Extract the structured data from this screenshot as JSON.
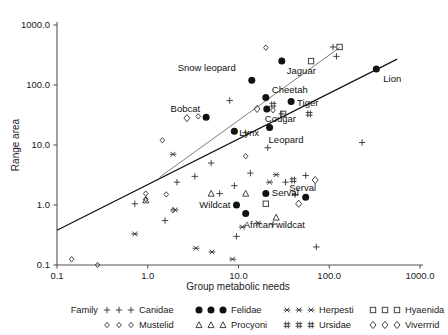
{
  "chart_data": {
    "type": "scatter",
    "title": "",
    "xlabel": "Group metabolic needs",
    "ylabel": "Range area",
    "xscale": "log",
    "yscale": "log",
    "xlim": [
      0.1,
      1000.0
    ],
    "ylim": [
      0.1,
      1000.0
    ],
    "xticks": [
      "0.1",
      "1.0",
      "10.0",
      "100.0",
      "1000.0"
    ],
    "yticks": [
      "0.1",
      "1.0",
      "10.0",
      "100.0",
      "1000.0"
    ],
    "grid": false,
    "legend_position": "below-axes",
    "series": [
      {
        "name": "Canidae",
        "marker": "plus",
        "points": [
          {
            "x": 0.72,
            "y": 1.05
          },
          {
            "x": 1.55,
            "y": 0.55
          },
          {
            "x": 2.1,
            "y": 2.4
          },
          {
            "x": 3.3,
            "y": 3.0
          },
          {
            "x": 5.0,
            "y": 5.0
          },
          {
            "x": 6.2,
            "y": 1.55
          },
          {
            "x": 8.0,
            "y": 55.0
          },
          {
            "x": 9.0,
            "y": 2.1
          },
          {
            "x": 9.5,
            "y": 0.3
          },
          {
            "x": 12.0,
            "y": 16.0
          },
          {
            "x": 13.5,
            "y": 3.4
          },
          {
            "x": 21.0,
            "y": 9.0
          },
          {
            "x": 24.0,
            "y": 0.48
          },
          {
            "x": 30.0,
            "y": 33.0
          },
          {
            "x": 33.0,
            "y": 2.4
          },
          {
            "x": 42.0,
            "y": 1.5
          },
          {
            "x": 55.0,
            "y": 3.1
          },
          {
            "x": 72.0,
            "y": 0.2
          },
          {
            "x": 110.0,
            "y": 430.0
          },
          {
            "x": 120.0,
            "y": 300.0
          },
          {
            "x": 230.0,
            "y": 11.0
          }
        ]
      },
      {
        "name": "Felidae",
        "marker": "filled-circle",
        "points": [
          {
            "x": 4.4,
            "y": 29.0,
            "label": "Bobcat"
          },
          {
            "x": 9.0,
            "y": 17.0,
            "label": "Lynx"
          },
          {
            "x": 14.0,
            "y": 120.0,
            "label": "Snow leopard"
          },
          {
            "x": 20.0,
            "y": 62.0,
            "label": "Cheetah"
          },
          {
            "x": 20.5,
            "y": 40.0,
            "label": "Cougar"
          },
          {
            "x": 22.0,
            "y": 19.5,
            "label": "Leopard"
          },
          {
            "x": 30.0,
            "y": 250.0,
            "label": "Jaguar"
          },
          {
            "x": 38.0,
            "y": 53.0,
            "label": "Tiger"
          },
          {
            "x": 330.0,
            "y": 185.0,
            "label": "Lion"
          },
          {
            "x": 9.5,
            "y": 1.0,
            "label": "Wildcat"
          },
          {
            "x": 12.0,
            "y": 0.72,
            "label": "African wildcat"
          },
          {
            "x": 20.0,
            "y": 1.55,
            "label": "Serval"
          },
          {
            "x": 55.0,
            "y": 1.35,
            "label": "Serval"
          }
        ]
      },
      {
        "name": "Herpesti",
        "marker": "asterisk",
        "points": [
          {
            "x": 0.72,
            "y": 0.33
          },
          {
            "x": 1.9,
            "y": 7.0
          },
          {
            "x": 2.0,
            "y": 0.83
          },
          {
            "x": 3.4,
            "y": 0.19
          },
          {
            "x": 5.1,
            "y": 0.165
          },
          {
            "x": 8.6,
            "y": 0.125
          },
          {
            "x": 11.0,
            "y": 0.43
          },
          {
            "x": 16.5,
            "y": 0.5
          },
          {
            "x": 22.0,
            "y": 2.4
          },
          {
            "x": 26.0,
            "y": 3.2
          }
        ]
      },
      {
        "name": "Hyaenida",
        "marker": "open-square",
        "points": [
          {
            "x": 20.0,
            "y": 1.05
          },
          {
            "x": 31.0,
            "y": 33.0
          },
          {
            "x": 63.0,
            "y": 250.0
          },
          {
            "x": 130.0,
            "y": 430.0
          }
        ]
      },
      {
        "name": "Mustelid",
        "marker": "small-diamond",
        "points": [
          {
            "x": 0.145,
            "y": 0.125
          },
          {
            "x": 0.28,
            "y": 0.1
          },
          {
            "x": 0.95,
            "y": 1.55
          },
          {
            "x": 0.95,
            "y": 1.25
          },
          {
            "x": 1.45,
            "y": 12.0
          },
          {
            "x": 1.6,
            "y": 1.5
          },
          {
            "x": 1.9,
            "y": 0.82
          },
          {
            "x": 3.6,
            "y": 30.0
          },
          {
            "x": 12.0,
            "y": 6.5
          },
          {
            "x": 20.0,
            "y": 420.0
          },
          {
            "x": 24.0,
            "y": 38.0
          }
        ]
      },
      {
        "name": "Procyoni",
        "marker": "open-triangle",
        "points": [
          {
            "x": 0.95,
            "y": 1.2
          },
          {
            "x": 5.0,
            "y": 1.55
          },
          {
            "x": 12.0,
            "y": 1.55
          },
          {
            "x": 26.0,
            "y": 0.62
          }
        ]
      },
      {
        "name": "Ursidae",
        "marker": "double-plus",
        "points": [
          {
            "x": 24.0,
            "y": 47.0
          },
          {
            "x": 40.0,
            "y": 2.6
          },
          {
            "x": 60.0,
            "y": 33.0
          }
        ]
      },
      {
        "name": "Viverrrid",
        "marker": "open-diamond",
        "points": [
          {
            "x": 2.7,
            "y": 28.0
          },
          {
            "x": 16.0,
            "y": 40.0
          },
          {
            "x": 46.0,
            "y": 1.05
          },
          {
            "x": 70.0,
            "y": 2.6
          }
        ]
      }
    ],
    "trend_lines": [
      {
        "name": "lower-regression",
        "x1": 0.1,
        "y1": 0.38,
        "x2": 560.0,
        "y2": 270.0
      },
      {
        "name": "upper-regression",
        "x1": 1.35,
        "y1": 2.9,
        "x2": 130.0,
        "y2": 420.0
      }
    ],
    "point_labels": [
      "Snow leopard",
      "Jaguar",
      "Cheetah",
      "Tiger",
      "Lion",
      "Bobcat",
      "Cougar",
      "Lynx",
      "Leopard",
      "Wildcat",
      "African wildcat",
      "Serval",
      "Serval"
    ]
  },
  "legend": {
    "title": "Family",
    "entries": [
      {
        "label": "Canidae",
        "marker": "plus"
      },
      {
        "label": "Felidae",
        "marker": "filled-circle"
      },
      {
        "label": "Herpesti",
        "marker": "asterisk"
      },
      {
        "label": "Hyaenida",
        "marker": "open-square"
      },
      {
        "label": "Mustelid",
        "marker": "small-diamond"
      },
      {
        "label": "Procyoni",
        "marker": "open-triangle"
      },
      {
        "label": "Ursidae",
        "marker": "double-plus"
      },
      {
        "label": "Viverrrid",
        "marker": "open-diamond"
      }
    ]
  },
  "colors": {
    "background": "#ffffff",
    "axis": "#555555",
    "marker": "#3a3a3a",
    "filled_marker": "#111111",
    "fit_line": "#111111",
    "fit_line_upper": "#6f6f6f",
    "text": "#1a1a1a"
  }
}
